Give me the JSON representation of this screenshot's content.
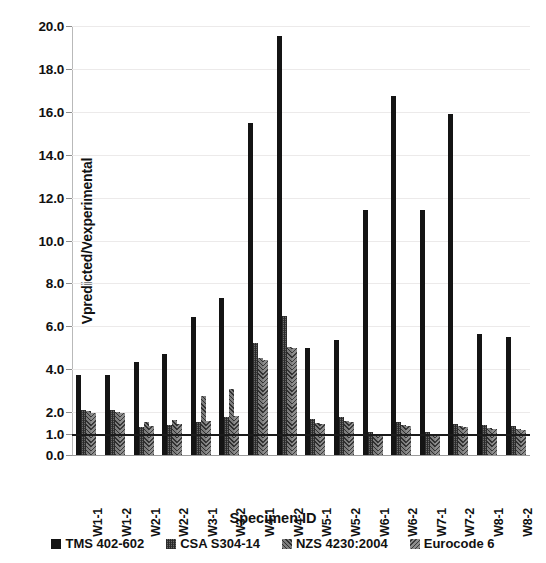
{
  "chart_data": {
    "type": "bar",
    "title": "",
    "xlabel": "Specimen ID",
    "ylabel": "Vpredicted/Vexperimental",
    "ylim": [
      0.0,
      20.0
    ],
    "ytick_step": 2.0,
    "grid": true,
    "legend_position": "bottom",
    "reference_line": 1.0,
    "ytick_labels": [
      "0.0",
      "1.0",
      "2.0",
      "4.0",
      "6.0",
      "8.0",
      "10.0",
      "12.0",
      "14.0",
      "16.0",
      "18.0",
      "20.0"
    ],
    "ytick_values": [
      0.0,
      1.0,
      2.0,
      4.0,
      6.0,
      8.0,
      10.0,
      12.0,
      14.0,
      16.0,
      18.0,
      20.0
    ],
    "categories": [
      "W1-1",
      "W1-2",
      "W2-1",
      "W2-2",
      "W3-1",
      "W3-2",
      "W4-1",
      "W4-2",
      "W5-1",
      "W5-2",
      "W6-1",
      "W6-2",
      "W7-1",
      "W7-2",
      "W8-1",
      "W8-2"
    ],
    "series": [
      {
        "name": "TMS 402-602",
        "swatch": "solid-black",
        "color": "#141414",
        "values": [
          3.75,
          3.75,
          4.35,
          4.7,
          6.45,
          7.3,
          15.5,
          19.55,
          5.0,
          5.35,
          11.4,
          16.75,
          11.4,
          15.9,
          5.65,
          5.5
        ]
      },
      {
        "name": "CSA S304-14",
        "swatch": "dense-dark-hatch",
        "color": "#6a6a6a",
        "values": [
          2.1,
          2.1,
          1.3,
          1.4,
          1.55,
          1.75,
          5.2,
          6.5,
          1.7,
          1.75,
          1.05,
          1.55,
          1.05,
          1.45,
          1.4,
          1.35
        ]
      },
      {
        "name": "NZS 4230:2004",
        "swatch": "medium-hatch",
        "color": "#7c7c7c",
        "values": [
          2.05,
          2.0,
          1.55,
          1.65,
          2.75,
          3.1,
          4.5,
          5.05,
          1.5,
          1.6,
          1.0,
          1.4,
          1.0,
          1.35,
          1.25,
          1.2
        ]
      },
      {
        "name": "Eurocode 6",
        "swatch": "light-cross-hatch",
        "color": "#8d8d8d",
        "values": [
          1.95,
          1.95,
          1.35,
          1.45,
          1.6,
          1.8,
          4.45,
          5.0,
          1.45,
          1.55,
          0.95,
          1.35,
          0.95,
          1.3,
          1.2,
          1.15
        ]
      }
    ]
  },
  "legend": {
    "items": [
      {
        "label": "TMS 402-602"
      },
      {
        "label": "CSA S304-14"
      },
      {
        "label": "NZS 4230:2004"
      },
      {
        "label": "Eurocode 6"
      }
    ]
  }
}
